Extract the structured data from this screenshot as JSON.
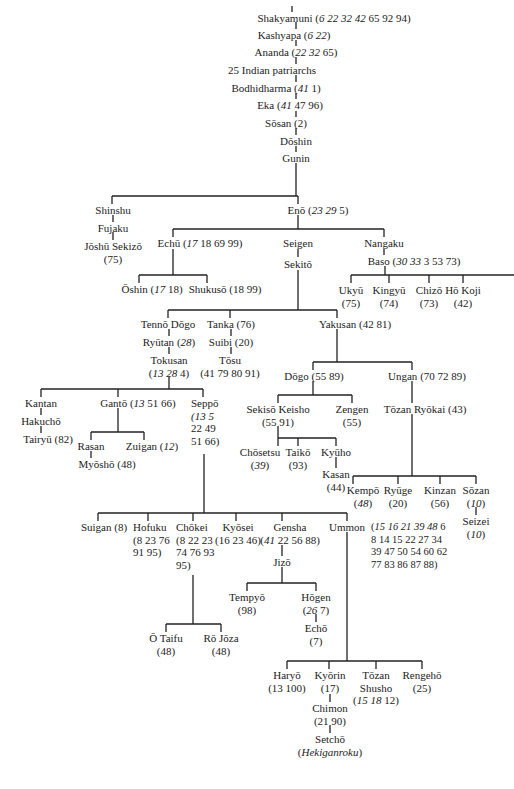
{
  "diagram": {
    "type": "lineage-tree",
    "nodes": {
      "shakyamuni": {
        "name": "Shakyamuni",
        "refs_italic": "6 22 32 42",
        "refs": "65 92 94"
      },
      "kashyapa": {
        "name": "Kashyapa",
        "refs_italic": "6 22",
        "refs": ""
      },
      "ananda": {
        "name": "Ananda",
        "refs_italic": "22 32",
        "refs": "65"
      },
      "indian": {
        "name": "25 Indian patriarchs"
      },
      "bodhidharma": {
        "name": "Bodhidharma",
        "refs_italic": "41",
        "refs": "1"
      },
      "eka": {
        "name": "Eka",
        "refs_italic": "41",
        "refs": "47 96"
      },
      "sosan": {
        "name": "Sōsan",
        "refs": "(2)"
      },
      "doshin": {
        "name": "Dōshin"
      },
      "gunin": {
        "name": "Gunin"
      },
      "shinshu": {
        "name": "Shinshu"
      },
      "fujaku": {
        "name": "Fujaku"
      },
      "joshu": {
        "name": "Jōshū Sekizō",
        "refs": "(75)"
      },
      "eno": {
        "name": "Enō",
        "refs_italic": "23 29",
        "refs": "5"
      },
      "echu": {
        "name": "Echū",
        "refs_italic": "17",
        "refs": "18 69 99"
      },
      "oshin": {
        "name": "Ōshin",
        "refs_italic": "17",
        "refs": "18"
      },
      "shukuso": {
        "name": "Shukusō",
        "refs": "(18 99)"
      },
      "seigen": {
        "name": "Seigen"
      },
      "sekito": {
        "name": "Sekitō"
      },
      "nangaku": {
        "name": "Nangaku"
      },
      "baso": {
        "name": "Baso",
        "refs_italic": "30 33",
        "refs": "3 53 73"
      },
      "ukyu": {
        "name": "Ukyū",
        "refs": "(75)"
      },
      "kingyu": {
        "name": "Kingyū",
        "refs": "(74)"
      },
      "chizo": {
        "name": "Chizō",
        "refs": "(73)"
      },
      "hokoji": {
        "name": "Hō Koji",
        "refs": "(42)"
      },
      "tenno": {
        "name": "Tennō Dōgo"
      },
      "ryutan": {
        "name": "Ryūtan",
        "refs_italic": "28"
      },
      "tokusan": {
        "name": "Tokusan",
        "refs_italic": "13 28",
        "refs": "4"
      },
      "tanka": {
        "name": "Tanka",
        "refs": "(76)"
      },
      "suibi": {
        "name": "Suibi",
        "refs": "(20)"
      },
      "tosu": {
        "name": "Tōsu",
        "refs": "(41 79 80 91)"
      },
      "yakusan": {
        "name": "Yakusan",
        "refs": "(42 81)"
      },
      "dogo": {
        "name": "Dōgo",
        "refs": "(55 89)"
      },
      "ungan": {
        "name": "Ungan",
        "refs": "(70 72 89)"
      },
      "sekiso": {
        "name": "Sekisō Keisho",
        "refs": "(55 91)"
      },
      "zengen": {
        "name": "Zengen",
        "refs": "(55)"
      },
      "tozanryokai": {
        "name": "Tōzan Ryōkai",
        "refs": "(43)"
      },
      "chosetsu": {
        "name": "Chōsetsu",
        "refs_italic": "39"
      },
      "taiko": {
        "name": "Taikō",
        "refs": "(93)"
      },
      "kyuho": {
        "name": "Kyūho"
      },
      "kasan": {
        "name": "Kasan",
        "refs": "(44)"
      },
      "kempo": {
        "name": "Kempō",
        "refs_italic": "48"
      },
      "ryuge": {
        "name": "Ryūge",
        "refs": "(20)"
      },
      "kinzan": {
        "name": "Kinzan",
        "refs": "(56)"
      },
      "sozan": {
        "name": "Sōzan",
        "refs_italic": "10"
      },
      "seizei": {
        "name": "Seizei",
        "refs_italic": "10"
      },
      "kantan": {
        "name": "Kantan"
      },
      "hakucho": {
        "name": "Hakuchō"
      },
      "tairyu": {
        "name": "Tairyū",
        "refs": "(82)"
      },
      "ganto": {
        "name": "Gantō",
        "refs_italic": "13",
        "refs": "51 66"
      },
      "rasan": {
        "name": "Rasan"
      },
      "myosho": {
        "name": "Myōshō",
        "refs": "(48)"
      },
      "zuigan": {
        "name": "Zuigan",
        "refs_italic": "12"
      },
      "seppo": {
        "name": "Seppō",
        "refs_lines": [
          "(13  5",
          "22  49",
          "51 66)"
        ]
      },
      "suigan": {
        "name": "Suigan",
        "refs": "(8)"
      },
      "hofuku": {
        "name": "Hofuku",
        "refs_lines": [
          "(8 23 76",
          "91 95)"
        ]
      },
      "chokei": {
        "name": "Chōkei",
        "refs_lines": [
          "(8  22  23",
          "74 76 93",
          "95)"
        ]
      },
      "kyosei": {
        "name": "Kyōsei",
        "refs": "(16 23 46)"
      },
      "gensha": {
        "name": "Gensha",
        "refs_italic": "41",
        "refs": "22 56 88"
      },
      "ummon": {
        "name": "Ummon",
        "refs_lines_italic": "15 16 21 39 48",
        "refs_lines": [
          "6",
          "8 14 15 22 27 34",
          "39 47 50 54 60 62",
          "77 83 86 87 88)"
        ]
      },
      "otaifu": {
        "name": "Ō Taifu",
        "refs": "(48)"
      },
      "rojoza": {
        "name": "Rō Jōza",
        "refs": "(48)"
      },
      "jizo": {
        "name": "Jizō"
      },
      "tempyo": {
        "name": "Tempyō",
        "refs": "(98)"
      },
      "hogen": {
        "name": "Hōgen",
        "refs_italic": "26",
        "refs": "7"
      },
      "echo": {
        "name": "Echō",
        "refs": "(7)"
      },
      "haryo": {
        "name": "Haryō",
        "refs": "(13 100)"
      },
      "kyorin": {
        "name": "Kyōrin",
        "refs": "(17)"
      },
      "chimon": {
        "name": "Chimon",
        "refs": "(21 90)"
      },
      "setcho": {
        "name": "Setchō",
        "refs_italic": "Hekiganroku"
      },
      "tozanshusho": {
        "name": "Tōzan",
        "name2": "Shusho",
        "refs_italic": "15 18",
        "refs": "12"
      },
      "rengeho": {
        "name": "Rengehō",
        "refs": "(25)"
      }
    }
  }
}
